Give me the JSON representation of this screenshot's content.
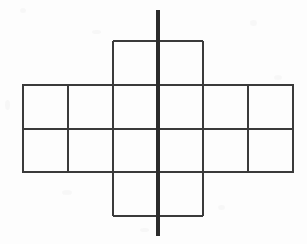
{
  "figure": {
    "description": "Line drawing of a cross-shaped polyomino net made of grid squares with a thick vertical line of symmetry drawn through the middle",
    "canvas": {
      "width": 307,
      "height": 244,
      "background_color": "#fdfdfd"
    },
    "styles": {
      "grid_line_color": "#3a3a3a",
      "grid_line_width": 2,
      "axis_line_color": "#2b2b2b",
      "axis_line_width": 4
    },
    "geometry": {
      "cell_width": 45,
      "cell_height": 43.5,
      "band_left": 23,
      "band_right": 293,
      "band_top": 85,
      "band_bottom": 172,
      "column_x": [
        23,
        68,
        113,
        158,
        203,
        248,
        293
      ],
      "row_y": [
        85,
        128.5,
        172
      ],
      "top_square": {
        "left": 113,
        "right": 203,
        "top": 41,
        "bottom": 85
      },
      "bottom_square": {
        "left": 113,
        "right": 203,
        "top": 172,
        "bottom": 216
      },
      "axis_x": 158,
      "axis_top": 10,
      "axis_bottom": 236
    },
    "shapes": {
      "outline_label": "net-outline",
      "horizontal_band_label": "horizontal-band",
      "top_block_label": "top-block",
      "bottom_block_label": "bottom-block",
      "axis_label": "vertical-symmetry-line"
    },
    "counts": {
      "columns_in_band": 6,
      "rows_in_band": 2,
      "total_cells": 14
    }
  }
}
